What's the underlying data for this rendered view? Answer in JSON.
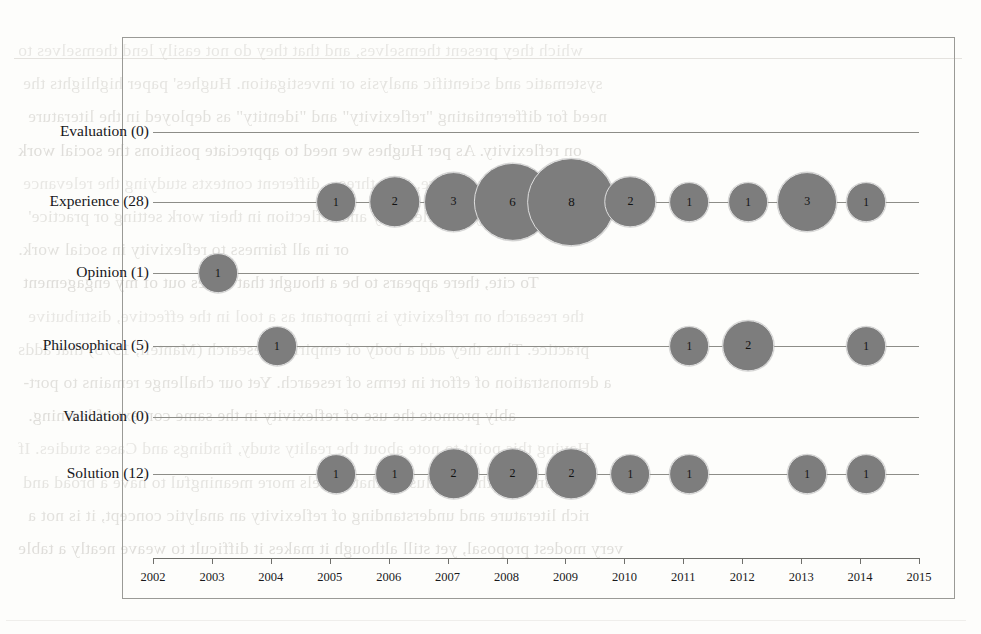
{
  "chart_data": {
    "type": "scatter",
    "title": "",
    "xlabel": "",
    "ylabel": "",
    "grid": false,
    "legend": "none",
    "x": [
      2002,
      2003,
      2004,
      2005,
      2006,
      2007,
      2008,
      2009,
      2010,
      2011,
      2012,
      2013,
      2014,
      2015
    ],
    "xlim": [
      2002,
      2015
    ],
    "x_tick_labels": [
      "2002",
      "2003",
      "2004",
      "2005",
      "2006",
      "2007",
      "2008",
      "2009",
      "2010",
      "2011",
      "2012",
      "2013",
      "2014",
      "2015"
    ],
    "categories": [
      "Evaluation (0)",
      "Experience (28)",
      "Opinion (1)",
      "Philosophical (5)",
      "Validation (0)",
      "Solution (12)"
    ],
    "series": [
      {
        "name": "Evaluation (0)",
        "label": "Evaluation (0)",
        "total": 0,
        "points": []
      },
      {
        "name": "Experience (28)",
        "label": "Experience (28)",
        "total": 28,
        "points": [
          {
            "year": 2005,
            "value": 1
          },
          {
            "year": 2006,
            "value": 2
          },
          {
            "year": 2007,
            "value": 3
          },
          {
            "year": 2008,
            "value": 6
          },
          {
            "year": 2009,
            "value": 8
          },
          {
            "year": 2010,
            "value": 2
          },
          {
            "year": 2011,
            "value": 1
          },
          {
            "year": 2012,
            "value": 1
          },
          {
            "year": 2013,
            "value": 3
          },
          {
            "year": 2014,
            "value": 1
          }
        ]
      },
      {
        "name": "Opinion (1)",
        "label": "Opinion (1)",
        "total": 1,
        "points": [
          {
            "year": 2003,
            "value": 1
          }
        ]
      },
      {
        "name": "Philosophical (5)",
        "label": "Philosophical (5)",
        "total": 5,
        "points": [
          {
            "year": 2004,
            "value": 1
          },
          {
            "year": 2011,
            "value": 1
          },
          {
            "year": 2012,
            "value": 2
          },
          {
            "year": 2014,
            "value": 1
          }
        ]
      },
      {
        "name": "Validation (0)",
        "label": "Validation (0)",
        "total": 0,
        "points": []
      },
      {
        "name": "Solution (12)",
        "label": "Solution (12)",
        "total": 12,
        "points": [
          {
            "year": 2005,
            "value": 1
          },
          {
            "year": 2006,
            "value": 1
          },
          {
            "year": 2007,
            "value": 2
          },
          {
            "year": 2008,
            "value": 2
          },
          {
            "year": 2009,
            "value": 2
          },
          {
            "year": 2010,
            "value": 1
          },
          {
            "year": 2011,
            "value": 1
          },
          {
            "year": 2013,
            "value": 1
          },
          {
            "year": 2014,
            "value": 1
          }
        ]
      }
    ],
    "colors": {
      "bubble_fill": "#7d7d7d",
      "bubble_stroke": "#dedede",
      "axis": "#6f6f6b",
      "row_line": "#8d8d88",
      "frame": "#9a9a96",
      "text": "#17171a",
      "page_background": "#fdfdfb"
    }
  },
  "page_ghost_text": {
    "note": "faint bleed-through text from the reverse of the scanned page",
    "lines": [
      "which they present themselves, and that they do not easily lend themselves to",
      "systematic and scientific analysis or investigation. Hughes' paper highlights the",
      "need for differentiating \"reflexivity\" and \"identity\" as deployed in the literature",
      "on reflexivity. As per Hughes we need to appreciate positions the social work",
      "students take as 'we are, two, three .. different contexts studying the relevance",
      "and applicability of reflexivity and reflection in their work setting or practice'",
      "or in all fairness to reflexivity in social work.",
      "To cite, there appears to be a thought that arises out of my engagement",
      "the research on reflexivity is important as a tool in the effective, distributive",
      "practice. Thus they add a body of empirical research (Mantell, 1975) that adds",
      "a demonstration of effort in terms of research. Yet our challenge remains to port-",
      "ably promote the use of reflexivity in the same context of learning.",
      "Having this point to note about the reality study, findings and Cases studies. If",
      "one comes to the conclusion that it feels more meaningful to have a broad and",
      "rich literature and understanding of reflexivity an analytic concept, it is not a",
      "very modest proposal, yet still although it makes it difficult to weave neatly a table"
    ]
  }
}
